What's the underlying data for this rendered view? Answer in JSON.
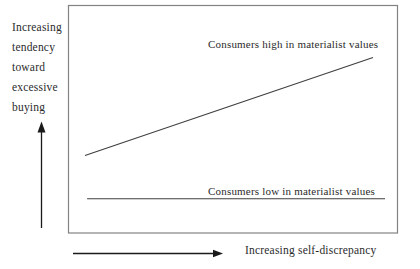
{
  "figure": {
    "ylabel_lines": [
      "Increasing",
      "tendency",
      "toward",
      "excessive",
      "buying"
    ],
    "xlabel": "Increasing self-discrepancy",
    "colors": {
      "series_line": "#3f3f3f",
      "box_border": "#828282",
      "arrow": "#1a1a1a",
      "text": "#2b2b2b",
      "background": "#ffffff"
    }
  },
  "chart_data": {
    "type": "line",
    "title": "",
    "xlabel": "Increasing self-discrepancy",
    "ylabel": "Increasing tendency toward excessive buying",
    "axes_conceptual": true,
    "grid": false,
    "legend_position": "inline-above-lines",
    "series": [
      {
        "name": "Consumers high in materialist values",
        "x": [
          0.0,
          0.96
        ],
        "y": [
          0.34,
          0.77
        ]
      },
      {
        "name": "Consumers low in materialist values",
        "x": [
          0.007,
          1.0
        ],
        "y": [
          0.15,
          0.15
        ]
      }
    ]
  }
}
